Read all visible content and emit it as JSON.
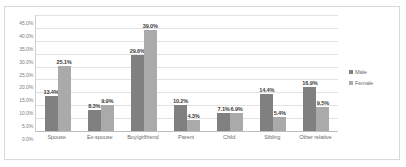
{
  "chart_data": {
    "type": "bar",
    "title": "",
    "subtitle": "",
    "xlabel": "",
    "ylabel": "",
    "ylim": [
      0,
      45
    ],
    "ytick_step": 5,
    "grid": true,
    "legend_position": "right",
    "value_labels": true,
    "categories": [
      "Spouse",
      "Ex-spouse",
      "Boy/girlfriend",
      "Parent",
      "Child",
      "Sibling",
      "Other relative"
    ],
    "ytick_labels": [
      "45.0%",
      "40.0%",
      "35.0%",
      "30.0%",
      "25.0%",
      "20.0%",
      "15.0%",
      "10.0%",
      "5.0%",
      "0.0%"
    ],
    "series": [
      {
        "name": "Male",
        "color": "#808080",
        "values": [
          13.4,
          8.3,
          29.6,
          10.2,
          7.1,
          14.4,
          16.9
        ],
        "labels": [
          "13.4%",
          "8.3%",
          "29.6%",
          "10.2%",
          "7.1%",
          "14.4%",
          "16.9%"
        ]
      },
      {
        "name": "Female",
        "color": "#aaaaaa",
        "values": [
          25.1,
          9.9,
          39.0,
          4.3,
          6.9,
          5.4,
          9.5
        ],
        "labels": [
          "25.1%",
          "9.9%",
          "39.0%",
          "4.3%",
          "6.9%",
          "5.4%",
          "9.5%"
        ]
      }
    ]
  },
  "legend": {
    "items": [
      {
        "label": "Male"
      },
      {
        "label": "Female"
      }
    ]
  }
}
